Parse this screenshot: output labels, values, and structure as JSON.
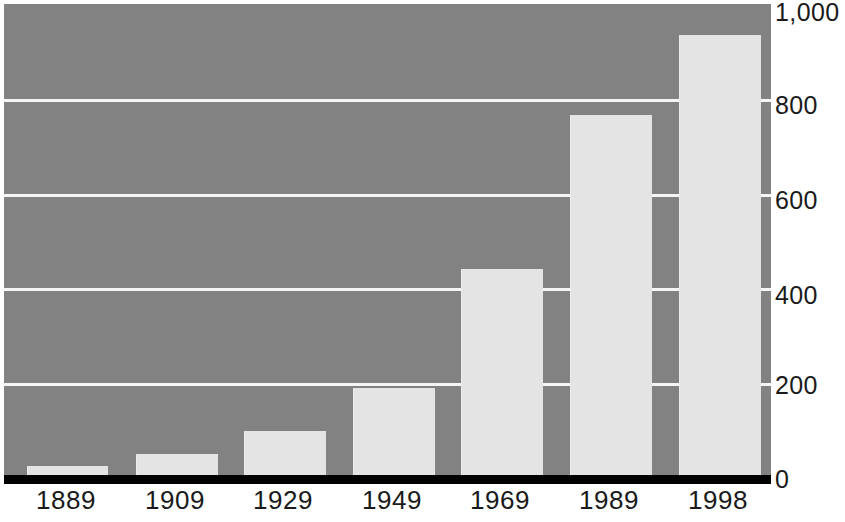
{
  "chart_data": {
    "type": "bar",
    "title": "",
    "subtitle": "",
    "xlabel": "",
    "ylabel": "",
    "categories": [
      "1889",
      "1909",
      "1929",
      "1949",
      "1969",
      "1989",
      "1998"
    ],
    "values": [
      25,
      50,
      100,
      190,
      440,
      765,
      935
    ],
    "series": [
      {
        "name": "",
        "values": [
          25,
          50,
          100,
          190,
          440,
          765,
          935
        ]
      }
    ],
    "ylim": [
      0,
      1000
    ],
    "y_ticks": [
      0,
      200,
      400,
      600,
      800,
      1000
    ],
    "y_tick_labels": [
      "0",
      "200",
      "400",
      "600",
      "800",
      "1,000"
    ],
    "grid": true,
    "grid_axis": "y",
    "legend": false,
    "legend_position": "none",
    "annotations": [],
    "colors": {
      "plot_background": "#828282",
      "bar_fill": "#e4e4e4",
      "gridline": "#f5f5f5",
      "axis_line": "#000000",
      "tick_label": "#1a1a1a",
      "page_background": "#ffffff"
    }
  }
}
